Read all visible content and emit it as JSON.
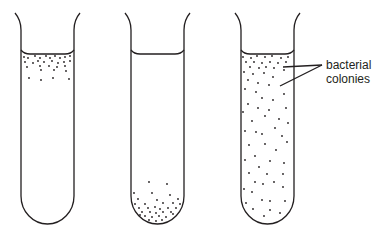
{
  "figure": {
    "stroke_color": "#231f20",
    "dot_color": "#231f20",
    "tubes": [
      {
        "id": "tube-1",
        "distribution": "colonies concentrated near top surface"
      },
      {
        "id": "tube-2",
        "distribution": "colonies concentrated at bottom"
      },
      {
        "id": "tube-3",
        "distribution": "colonies spread throughout"
      }
    ],
    "annotation": {
      "line1": "bacterial",
      "line2": "colonies"
    }
  }
}
